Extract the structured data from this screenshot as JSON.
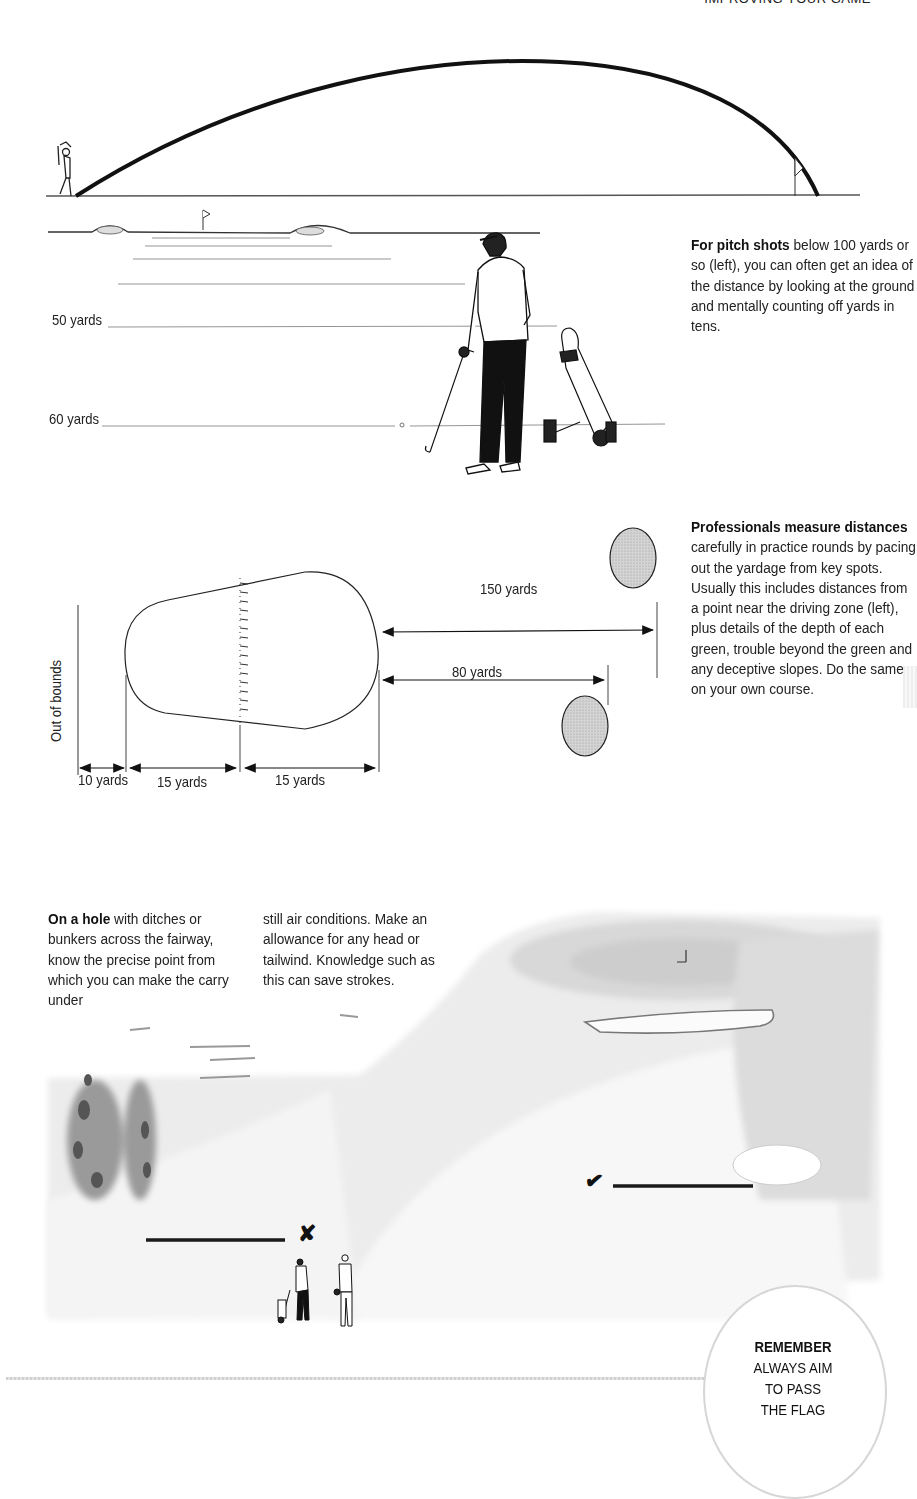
{
  "page": {
    "running_head": "IMPROVING YOUR GAME"
  },
  "figure_trajectory": {
    "description": "Golfer hitting a high pitch shot that lands beside the flag"
  },
  "figure_pitch": {
    "labels": [
      "50 yards",
      "60 yards"
    ],
    "caption": {
      "lead": "For pitch shots",
      "body": " below 100 yards or so (left), you can often get an idea of the distance by looking at the ground and mentally counting off yards in tens."
    }
  },
  "figure_green_plan": {
    "side_label": "Out of bounds",
    "distances": {
      "oob": "10 yards",
      "front_half": "15 yards",
      "back_half": "15 yards",
      "far_marker": "150 yards",
      "near_marker": "80 yards"
    },
    "caption": {
      "lead": "Professionals measure distances",
      "body": " carefully in practice rounds by pacing out the yardage from key spots. Usually this includes distances from a point near the driving zone (left), plus details of the depth of each green, trouble beyond the green and any deceptive slopes. Do the same on your own course."
    }
  },
  "figure_hole": {
    "caption_col1": {
      "lead": "On a hole",
      "body": " with ditches or bunkers across the fairway, know the precise point from which you can make the carry under"
    },
    "caption_col2": "still air conditions. Make an allowance for any head or tailwind. Knowledge such as this can save strokes.",
    "markers": {
      "wrong": "✘",
      "right": "✔"
    }
  },
  "remember_box": {
    "title": "REMEMBER",
    "lines": [
      "ALWAYS AIM",
      "TO PASS",
      "THE FLAG"
    ]
  },
  "colors": {
    "ink": "#1a1a1a",
    "green_fill": "#cfcfcf",
    "wash": "#e6e6e6",
    "rule": "#c8c8c8"
  }
}
